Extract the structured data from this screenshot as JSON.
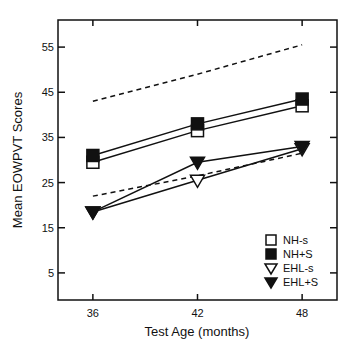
{
  "chart_data": {
    "type": "line",
    "title": "",
    "xlabel": "Test Age (months)",
    "ylabel": "Mean EOWPVT Scores",
    "x": [
      36,
      42,
      48
    ],
    "xticks": [
      36,
      42,
      48
    ],
    "yticks": [
      5,
      15,
      25,
      35,
      45,
      55
    ],
    "xlim": [
      34,
      50
    ],
    "ylim": [
      -1,
      61
    ],
    "grid": false,
    "legend_position": "bottom-right",
    "series": [
      {
        "name": "NH-s",
        "marker": "open-square",
        "line": "solid",
        "values": [
          29.5,
          36.5,
          42
        ]
      },
      {
        "name": "NH+S",
        "marker": "filled-square",
        "line": "solid",
        "values": [
          31,
          38,
          43.5
        ]
      },
      {
        "name": "EHL-s",
        "marker": "open-triangle-down",
        "line": "solid",
        "values": [
          18.5,
          25.5,
          32.5
        ]
      },
      {
        "name": "EHL+S",
        "marker": "filled-triangle-down",
        "line": "solid",
        "values": [
          18.5,
          29.5,
          33
        ]
      }
    ],
    "reference_lines": [
      {
        "name": "upper-dashed",
        "line": "dashed",
        "values": [
          43,
          49,
          55.5
        ]
      },
      {
        "name": "lower-dashed",
        "line": "dashed",
        "values": [
          22,
          26.5,
          31.5
        ]
      }
    ]
  }
}
